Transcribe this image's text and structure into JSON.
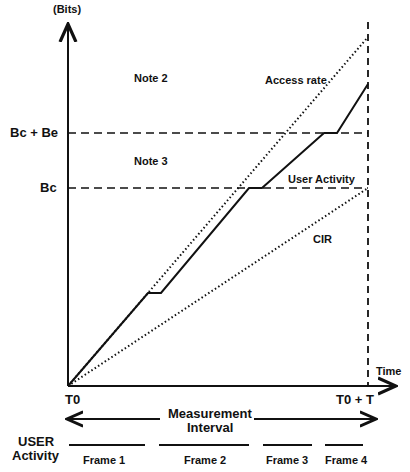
{
  "axes": {
    "y_label": "(Bits)",
    "x_label": "Time",
    "origin_label": "T0",
    "end_label": "T0 + T",
    "bc_plus_be": "Bc + Be",
    "bc": "Bc"
  },
  "notes": {
    "note2": "Note 2",
    "note3": "Note 3"
  },
  "lines": {
    "access_rate": "Access rate",
    "user_activity": "User Activity",
    "cir": "CIR"
  },
  "interval": {
    "line1": "Measurement",
    "line2": "Interval"
  },
  "activity": {
    "label_line1": "USER",
    "label_line2": "Activity",
    "frames": [
      "Frame 1",
      "Frame 2",
      "Frame 3",
      "Frame 4"
    ]
  }
}
